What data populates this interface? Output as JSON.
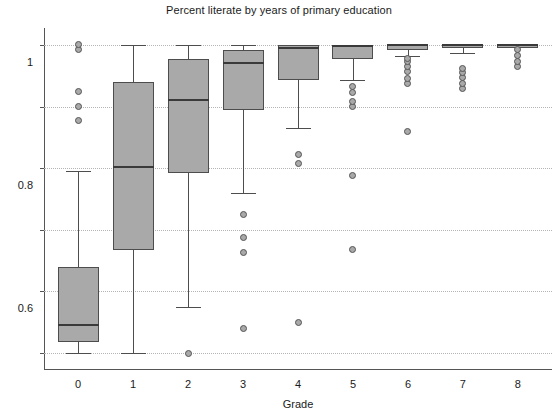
{
  "chart_data": {
    "type": "box",
    "title": "Percent literate by years of primary education",
    "xlabel": "Grade",
    "ylabel": "",
    "xlim": [
      -0.62,
      8.62
    ],
    "ylim": [
      -0.055,
      1.055
    ],
    "grid": true,
    "legend": null,
    "xticks": [
      "0",
      "1",
      "2",
      "3",
      "4",
      "5",
      "6",
      "7",
      "8"
    ],
    "yticks": [
      "0",
      "0.2",
      "0.4",
      "0.6",
      "0.8",
      "1"
    ],
    "ytick_values": [
      0,
      0.2,
      0.4,
      0.6,
      0.8,
      1
    ],
    "categories": [
      "0",
      "1",
      "2",
      "3",
      "4",
      "5",
      "6",
      "7",
      "8"
    ],
    "box_color": "#a9a9a9",
    "line_color": "#4d4d4d",
    "boxes": [
      {
        "category": "0",
        "x": 0,
        "whisker_low": 0.0,
        "q1": 0.035,
        "median": 0.09,
        "q3": 0.28,
        "whisker_high": 0.59,
        "outliers": [
          0.755,
          0.8,
          0.85,
          0.985,
          1.0
        ]
      },
      {
        "category": "1",
        "x": 1,
        "whisker_low": 0.0,
        "q1": 0.335,
        "median": 0.605,
        "q3": 0.88,
        "whisker_high": 1.0,
        "outliers": []
      },
      {
        "category": "2",
        "x": 2,
        "whisker_low": 0.15,
        "q1": 0.585,
        "median": 0.82,
        "q3": 0.955,
        "whisker_high": 1.0,
        "outliers": [
          0.0
        ]
      },
      {
        "category": "3",
        "x": 3,
        "whisker_low": 0.52,
        "q1": 0.79,
        "median": 0.94,
        "q3": 0.985,
        "whisker_high": 1.0,
        "outliers": [
          0.08,
          0.325,
          0.375,
          0.45
        ]
      },
      {
        "category": "4",
        "x": 4,
        "whisker_low": 0.73,
        "q1": 0.885,
        "median": 0.99,
        "q3": 1.0,
        "whisker_high": 1.0,
        "outliers": [
          0.1,
          0.615,
          0.645
        ]
      },
      {
        "category": "5",
        "x": 5,
        "whisker_low": 0.885,
        "q1": 0.955,
        "median": 0.995,
        "q3": 1.0,
        "whisker_high": 1.0,
        "outliers": [
          0.335,
          0.575,
          0.8,
          0.815,
          0.845,
          0.865
        ]
      },
      {
        "category": "6",
        "x": 6,
        "whisker_low": 0.965,
        "q1": 0.985,
        "median": 1.0,
        "q3": 1.0,
        "whisker_high": 1.0,
        "outliers": [
          0.72,
          0.875,
          0.89,
          0.915,
          0.93,
          0.945,
          0.955
        ]
      },
      {
        "category": "7",
        "x": 7,
        "whisker_low": 0.975,
        "q1": 0.99,
        "median": 1.0,
        "q3": 1.0,
        "whisker_high": 1.0,
        "outliers": [
          0.86,
          0.875,
          0.895,
          0.91,
          0.925
        ]
      },
      {
        "category": "8",
        "x": 8,
        "whisker_low": 1.0,
        "q1": 1.0,
        "median": 1.0,
        "q3": 1.0,
        "whisker_high": 1.0,
        "outliers": [
          0.93,
          0.945,
          0.965,
          0.985
        ]
      }
    ]
  }
}
